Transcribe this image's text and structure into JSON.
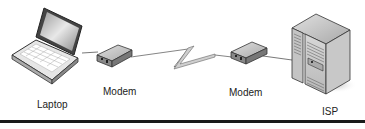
{
  "diagram": {
    "type": "network",
    "nodes": [
      {
        "id": "laptop",
        "label": "Laptop",
        "icon": "laptop-icon"
      },
      {
        "id": "modem1",
        "label": "Modem",
        "icon": "modem-icon"
      },
      {
        "id": "modem2",
        "label": "Modem",
        "icon": "modem-icon"
      },
      {
        "id": "isp",
        "label": "ISP",
        "icon": "server-icon"
      }
    ],
    "edges": [
      {
        "from": "laptop",
        "to": "modem1",
        "style": "line"
      },
      {
        "from": "modem1",
        "to": "modem2",
        "style": "lightning"
      },
      {
        "from": "modem2",
        "to": "isp",
        "style": "line"
      }
    ]
  },
  "colors": {
    "device_fill": "#c8c8c8",
    "device_stroke": "#333333",
    "rule": "#1a1a1a"
  }
}
